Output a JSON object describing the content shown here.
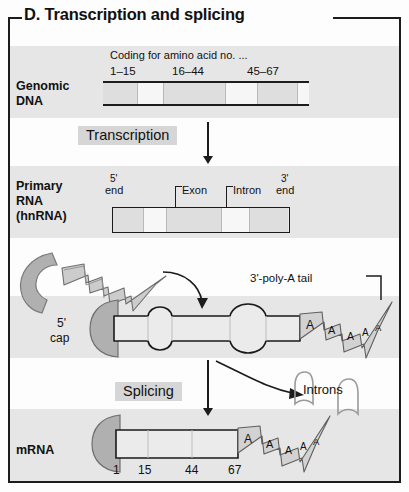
{
  "figure": {
    "panel_letter": "D.",
    "title": "Transcription and splicing",
    "full_title": "D.  Transcription and splicing"
  },
  "colors": {
    "ink": "#1c1c1c",
    "band_gray": "#e6e6e6",
    "chip_gray": "#d6d6d6",
    "segment_dark": "#dcdcdc",
    "segment_light": "#f4f4f4",
    "cap_gray": "#a8a8a8",
    "ribbon_gray": "#c8c8c8",
    "paper": "#fdfdfd"
  },
  "rows": {
    "genomic_dna": {
      "label_line1": "Genomic",
      "label_line2": "DNA",
      "coding_header": "Coding for amino acid no. ...",
      "exon_ranges": [
        "1–15",
        "16–44",
        "45–67"
      ]
    },
    "primary_rna": {
      "label_line1": "Primary",
      "label_line2": "RNA",
      "label_line3": "(hnRNA)",
      "five_prime": "5'",
      "five_prime_end": "end",
      "three_prime": "3'",
      "three_prime_end": "end",
      "exon_label": "Exon",
      "intron_label": "Intron"
    },
    "capped_rna": {
      "cap_line1": "5'",
      "cap_line2": "cap",
      "polya_label": "3'-poly-A tail",
      "polya_letters": [
        "A",
        "A",
        "A",
        "A",
        "A"
      ]
    },
    "mrna": {
      "label": "mRNA",
      "introns_label": "Introns",
      "polya_letters": [
        "A",
        "A",
        "A",
        "A",
        "A"
      ],
      "position_ticks": [
        "1",
        "15",
        "44",
        "67"
      ]
    }
  },
  "processes": {
    "transcription": "Transcription",
    "splicing": "Splicing"
  }
}
